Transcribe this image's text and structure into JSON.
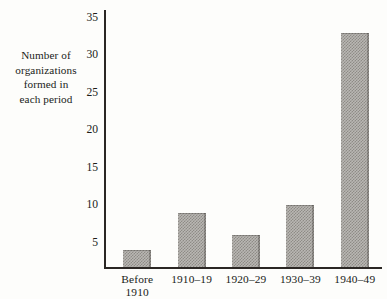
{
  "figure": {
    "background_color": "#fdfdfb",
    "ink_color": "#231f1c",
    "bar_fill_color": "#b9b7b3",
    "bar_hatch_color": "#8e8b86"
  },
  "y_axis_title": {
    "line1": "Number of",
    "line2": "organizations",
    "line3": "formed in",
    "line4": "each period"
  },
  "y_ticks": [
    {
      "label": "5",
      "value": 5
    },
    {
      "label": "10",
      "value": 10
    },
    {
      "label": "15",
      "value": 15
    },
    {
      "label": "20",
      "value": 20
    },
    {
      "label": "25",
      "value": 25
    },
    {
      "label": "30",
      "value": 30
    },
    {
      "label": "35",
      "value": 35
    }
  ],
  "x_ticks": [
    {
      "line1": "Before",
      "line2": "1910"
    },
    {
      "line1": "1910–19",
      "line2": ""
    },
    {
      "line1": "1920–29",
      "line2": ""
    },
    {
      "line1": "1930–39",
      "line2": ""
    },
    {
      "line1": "1940–49",
      "line2": ""
    }
  ],
  "chart_data": {
    "type": "bar",
    "title": "",
    "subtitle": "",
    "xlabel": "",
    "ylabel": "Number of organizations formed in each period",
    "categories": [
      "Before 1910",
      "1910–19",
      "1920–29",
      "1930–39",
      "1940–49"
    ],
    "values": [
      4,
      9,
      6,
      10,
      33
    ],
    "ylim": [
      1.8,
      36
    ],
    "ytick_values": [
      5,
      10,
      15,
      20,
      25,
      30,
      35
    ],
    "grid": false,
    "legend": false,
    "legend_position": "none"
  }
}
